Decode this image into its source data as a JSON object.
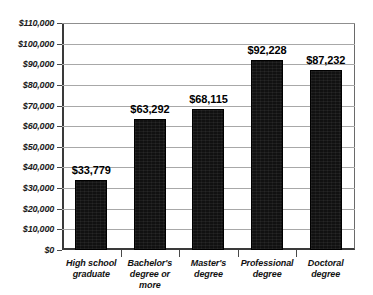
{
  "chart_data": {
    "type": "bar",
    "title": "",
    "subtitle": "",
    "xlabel": "",
    "ylabel": "",
    "ylim": [
      0,
      110000
    ],
    "ytick_step": 10000,
    "grid": true,
    "legend": null,
    "orientation": "vertical",
    "categories": [
      "High school graduate",
      "Bachelor's degree or more",
      "Master's degree",
      "Professional degree",
      "Doctoral degree"
    ],
    "category_lines": [
      [
        "High school",
        "graduate"
      ],
      [
        "Bachelor's",
        "degree or more"
      ],
      [
        "Master's",
        "degree"
      ],
      [
        "Professional",
        "degree"
      ],
      [
        "Doctoral",
        "degree"
      ]
    ],
    "values": [
      33779,
      63292,
      68115,
      92228,
      87232
    ],
    "value_labels": [
      "$33,779",
      "$63,292",
      "$68,115",
      "$92,228",
      "$87,232"
    ],
    "ytick_labels": [
      "$0",
      "$10,000",
      "$20,000",
      "$30,000",
      "$40,000",
      "$50,000",
      "$60,000",
      "$70,000",
      "$80,000",
      "$90,000",
      "$100,000",
      "$110,000"
    ],
    "ytick_values": [
      0,
      10000,
      20000,
      30000,
      40000,
      50000,
      60000,
      70000,
      80000,
      90000,
      100000,
      110000
    ],
    "colors": {
      "bar": "#111111",
      "gridline": "#a8a8a8",
      "axis": "#3a3a3a",
      "text": "#000000",
      "background": "#ffffff"
    }
  }
}
